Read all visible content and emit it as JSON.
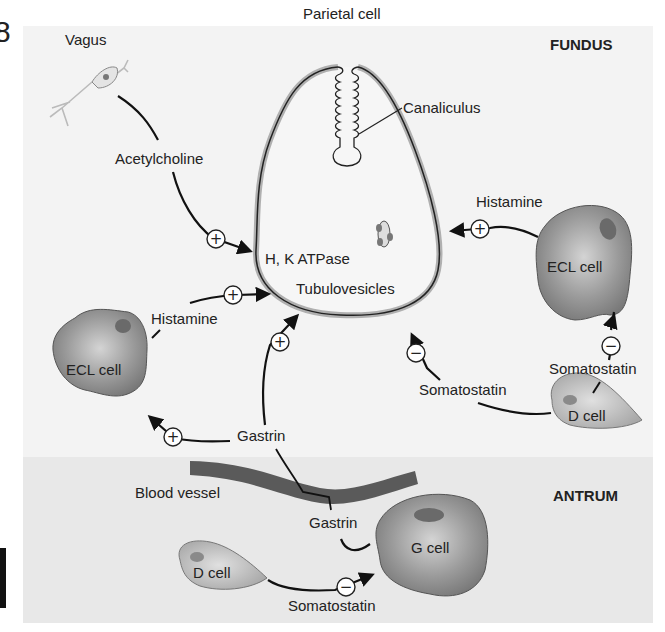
{
  "figure": {
    "number_fragment": "8",
    "regions": {
      "fundus": {
        "label": "FUNDUS",
        "background": "#f3f3f3"
      },
      "antrum": {
        "label": "ANTRUM",
        "background": "#e8e8e8"
      }
    }
  },
  "cells": {
    "parietal": {
      "label": "Parietal cell",
      "canaliculus_label": "Canaliculus",
      "pump_label": "H, K ATPase",
      "vesicle_label": "Tubulovesicles"
    },
    "vagus": {
      "label": "Vagus"
    },
    "ecl_fundus": {
      "label": "ECL cell"
    },
    "ecl_left": {
      "label": "ECL cell"
    },
    "d_cell_fundus": {
      "label": "D cell"
    },
    "d_cell_antrum": {
      "label": "D cell"
    },
    "g_cell": {
      "label": "G cell"
    },
    "blood_vessel": {
      "label": "Blood vessel"
    }
  },
  "signals": {
    "acetylcholine": {
      "label": "Acetylcholine",
      "effect": "+"
    },
    "histamine_right": {
      "label": "Histamine",
      "effect": "+"
    },
    "histamine_left": {
      "label": "Histamine",
      "effect": "+"
    },
    "gastrin_to_parietal": {
      "label": "Gastrin",
      "effect": "+"
    },
    "gastrin_to_ecl": {
      "effect": "+"
    },
    "gastrin_from_g": {
      "label": "Gastrin"
    },
    "somatostatin_to_parietal": {
      "label": "Somatostatin",
      "effect": "−"
    },
    "somatostatin_to_ecl": {
      "label": "Somatostatin",
      "effect": "−"
    },
    "somatostatin_to_g": {
      "label": "Somatostatin",
      "effect": "−"
    }
  },
  "colors": {
    "cell_fill": "#8e8e8e",
    "cell_highlight": "#c9c9c9",
    "nucleus": "#6a6a6a",
    "d_cell_fill": "#b5b5b5",
    "vessel": "#5a5a5a",
    "parietal_rim": "#b0b0b0"
  }
}
